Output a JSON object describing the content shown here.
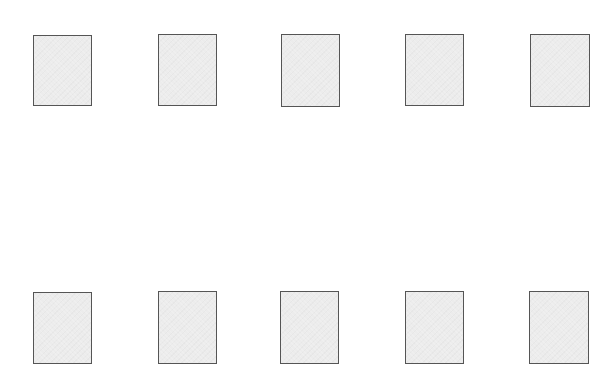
{
  "canvas": {
    "width": 616,
    "height": 377,
    "background": "#ffffff"
  },
  "style": {
    "box_fill": "#ececec",
    "box_border": "#555555"
  },
  "rows": [
    {
      "name": "top-row",
      "boxes": [
        {
          "x": 33,
          "y": 35,
          "w": 59,
          "h": 71
        },
        {
          "x": 158,
          "y": 34,
          "w": 59,
          "h": 72
        },
        {
          "x": 281,
          "y": 34,
          "w": 59,
          "h": 73
        },
        {
          "x": 405,
          "y": 34,
          "w": 59,
          "h": 72
        },
        {
          "x": 530,
          "y": 34,
          "w": 60,
          "h": 73
        }
      ]
    },
    {
      "name": "bottom-row",
      "boxes": [
        {
          "x": 33,
          "y": 292,
          "w": 59,
          "h": 72
        },
        {
          "x": 158,
          "y": 291,
          "w": 59,
          "h": 73
        },
        {
          "x": 280,
          "y": 291,
          "w": 59,
          "h": 73
        },
        {
          "x": 405,
          "y": 291,
          "w": 59,
          "h": 73
        },
        {
          "x": 529,
          "y": 291,
          "w": 60,
          "h": 73
        }
      ]
    }
  ]
}
